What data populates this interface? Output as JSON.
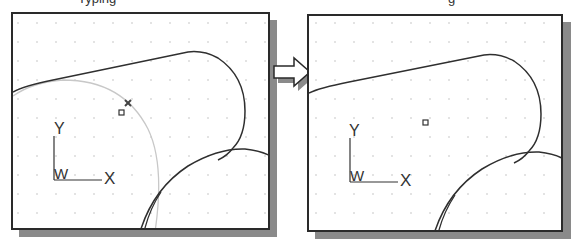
{
  "figure": {
    "captions": [
      {
        "text": "Typing",
        "x": 78
      },
      {
        "text": "g",
        "x": 448
      }
    ],
    "colors": {
      "background": "#ffffff",
      "frame": "#2a2a2a",
      "shadow": "#8a8a8a",
      "curve": "#2f2f2f",
      "construction_curve": "#c8c8c8",
      "grid_dot": "#b0b0b0"
    },
    "grid": {
      "spacing": 19,
      "offset_x": 4,
      "offset_y": 8
    },
    "panels": [
      {
        "id": "before",
        "ucs_icon": {
          "x_label": "X",
          "y_label": "Y",
          "w_label": "W"
        },
        "markers": [
          "snap-square-marker",
          "cursor-x-marker"
        ],
        "has_construction_arc": true
      },
      {
        "id": "after",
        "ucs_icon": {
          "x_label": "X",
          "y_label": "Y",
          "w_label": "W"
        },
        "markers": [
          "snap-square-marker"
        ],
        "has_construction_arc": false
      }
    ],
    "arrow": {
      "direction": "right"
    }
  }
}
